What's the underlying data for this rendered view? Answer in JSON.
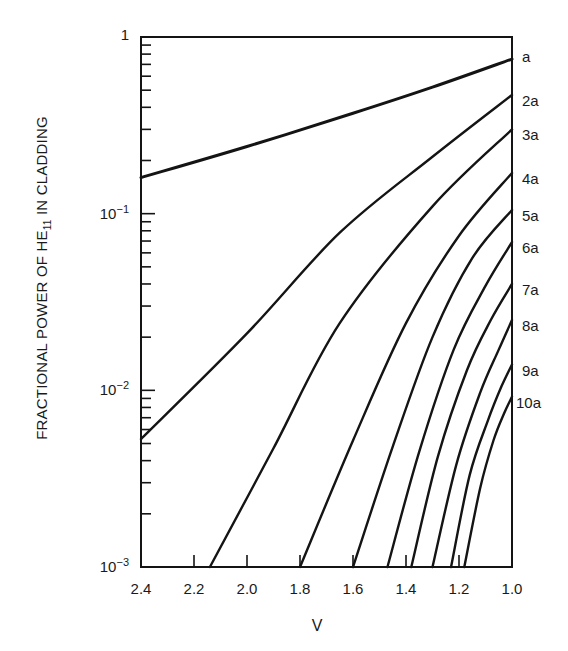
{
  "chart_data": {
    "type": "line",
    "title": "",
    "xlabel": "V",
    "ylabel_parts": {
      "pre": "FRACTIONAL POWER OF HE",
      "sub": "11",
      "post": " IN CLADDING"
    },
    "ylabel": "FRACTIONAL POWER OF HE11 IN CLADDING",
    "xscale": "linear",
    "yscale": "log",
    "xlim": [
      2.4,
      1.0
    ],
    "ylim": [
      0.001,
      1
    ],
    "x_reversed": true,
    "x_ticks": [
      "2.4",
      "2.2",
      "2.0",
      "1.8",
      "1.6",
      "1.4",
      "1.2",
      "1.0"
    ],
    "x_tick_values": [
      2.4,
      2.2,
      2.0,
      1.8,
      1.6,
      1.4,
      1.2,
      1.0
    ],
    "y_ticks": [
      {
        "value": 1,
        "base": "1",
        "exp": ""
      },
      {
        "value": 0.1,
        "base": "10",
        "exp": "−1"
      },
      {
        "value": 0.01,
        "base": "10",
        "exp": "−2"
      },
      {
        "value": 0.001,
        "base": "10",
        "exp": "−3"
      }
    ],
    "grid": false,
    "legend_position": "right-edge labels",
    "series": [
      {
        "name": "a",
        "points": [
          [
            2.4,
            0.16
          ],
          [
            2.0,
            0.24
          ],
          [
            1.6,
            0.37
          ],
          [
            1.3,
            0.52
          ],
          [
            1.0,
            0.75
          ]
        ]
      },
      {
        "name": "2a",
        "points": [
          [
            2.4,
            0.0053
          ],
          [
            2.0,
            0.021
          ],
          [
            1.65,
            0.078
          ],
          [
            1.3,
            0.21
          ],
          [
            1.0,
            0.47
          ]
        ]
      },
      {
        "name": "3a",
        "points": [
          [
            2.14,
            0.001
          ],
          [
            1.9,
            0.0047
          ],
          [
            1.65,
            0.024
          ],
          [
            1.3,
            0.11
          ],
          [
            1.0,
            0.3
          ]
        ]
      },
      {
        "name": "4a",
        "points": [
          [
            1.8,
            0.001
          ],
          [
            1.6,
            0.0052
          ],
          [
            1.4,
            0.024
          ],
          [
            1.2,
            0.075
          ],
          [
            1.0,
            0.17
          ]
        ]
      },
      {
        "name": "5a",
        "points": [
          [
            1.6,
            0.001
          ],
          [
            1.45,
            0.0048
          ],
          [
            1.3,
            0.02
          ],
          [
            1.15,
            0.056
          ],
          [
            1.0,
            0.105
          ]
        ]
      },
      {
        "name": "6a",
        "points": [
          [
            1.47,
            0.001
          ],
          [
            1.35,
            0.0045
          ],
          [
            1.22,
            0.017
          ],
          [
            1.1,
            0.039
          ],
          [
            1.0,
            0.069
          ]
        ]
      },
      {
        "name": "7a",
        "points": [
          [
            1.38,
            0.001
          ],
          [
            1.28,
            0.0042
          ],
          [
            1.17,
            0.013
          ],
          [
            1.08,
            0.025
          ],
          [
            1.0,
            0.04
          ]
        ]
      },
      {
        "name": "8a",
        "points": [
          [
            1.3,
            0.001
          ],
          [
            1.21,
            0.0038
          ],
          [
            1.12,
            0.0097
          ],
          [
            1.05,
            0.017
          ],
          [
            1.0,
            0.025
          ]
        ]
      },
      {
        "name": "9a",
        "points": [
          [
            1.23,
            0.001
          ],
          [
            1.16,
            0.0033
          ],
          [
            1.09,
            0.0068
          ],
          [
            1.04,
            0.0105
          ],
          [
            1.0,
            0.014
          ]
        ]
      },
      {
        "name": "10a",
        "points": [
          [
            1.18,
            0.001
          ],
          [
            1.12,
            0.0028
          ],
          [
            1.07,
            0.0052
          ],
          [
            1.03,
            0.0074
          ],
          [
            1.0,
            0.0092
          ]
        ]
      }
    ]
  },
  "style": {
    "line_color": "#141414",
    "axis_color": "#141414",
    "background": "#ffffff"
  }
}
